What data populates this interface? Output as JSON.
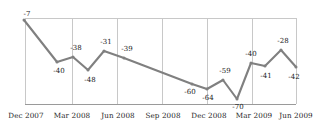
{
  "chart_data": {
    "type": "line",
    "title": "",
    "xlabel": "",
    "ylabel": "",
    "grid": true,
    "legend": false,
    "legend_position": "none",
    "line_color": "#808080",
    "label_color": "#1a1a1a",
    "gridline_color": "#c8c8c8",
    "axis_color": "#9a9a9a",
    "ylim": [
      -75,
      0
    ],
    "categories": [
      "Dec 2007",
      "Jan 2008",
      "Feb 2008",
      "Mar 2008",
      "Apr 2008",
      "May 2008",
      "Jun 2008",
      "Sep 2008",
      "Dec 2008",
      "Jan 2009",
      "Mar 2009",
      "Apr 2009",
      "Jun 2009"
    ],
    "values": [
      -7,
      -40,
      -38,
      -48,
      -31,
      -39,
      -60,
      -64,
      -59,
      -70,
      -40,
      -41,
      -28
    ],
    "point_labels": [
      "-7",
      "-40",
      "-38",
      "-48",
      "-31",
      "-39",
      "-60",
      "-64",
      "-59",
      "-70",
      "-40",
      "-41",
      "-28",
      "-42"
    ],
    "series": [
      {
        "name": "series-1",
        "points": [
          {
            "label": "-7",
            "value": -7,
            "x": 24,
            "y": 20,
            "label_x": 27,
            "label_y": 14,
            "label_align": "above-right"
          },
          {
            "label": "-40",
            "value": -40,
            "x": 57,
            "y": 62,
            "label_x": 59,
            "label_y": 71,
            "label_align": "below"
          },
          {
            "label": "-38",
            "value": -38,
            "x": 73,
            "y": 57,
            "label_x": 76,
            "label_y": 48,
            "label_align": "above"
          },
          {
            "label": "-48",
            "value": -48,
            "x": 88,
            "y": 70,
            "label_x": 90,
            "label_y": 80,
            "label_align": "below"
          },
          {
            "label": "-31",
            "value": -31,
            "x": 104,
            "y": 51,
            "label_x": 106,
            "label_y": 42,
            "label_align": "above"
          },
          {
            "label": "-39",
            "value": -39,
            "x": 124,
            "y": 58,
            "label_x": 127,
            "label_y": 49,
            "label_align": "above"
          },
          {
            "label": "-60",
            "value": -60,
            "x": 192,
            "y": 84,
            "label_x": 190,
            "label_y": 92,
            "label_align": "below"
          },
          {
            "label": "-64",
            "value": -64,
            "x": 207,
            "y": 89,
            "label_x": 208,
            "label_y": 98,
            "label_align": "below"
          },
          {
            "label": "-59",
            "value": -59,
            "x": 223,
            "y": 80,
            "label_x": 225,
            "label_y": 71,
            "label_align": "above"
          },
          {
            "label": "-70",
            "value": -70,
            "x": 237,
            "y": 99,
            "label_x": 238,
            "label_y": 107,
            "label_align": "below"
          },
          {
            "label": "-40",
            "value": -40,
            "x": 251,
            "y": 63,
            "label_x": 251,
            "label_y": 54,
            "label_align": "above"
          },
          {
            "label": "-41",
            "value": -41,
            "x": 265,
            "y": 66,
            "label_x": 266,
            "label_y": 76,
            "label_align": "below"
          },
          {
            "label": "-28",
            "value": -28,
            "x": 281,
            "y": 50,
            "label_x": 283,
            "label_y": 41,
            "label_align": "above"
          },
          {
            "label": "-42",
            "value": -42,
            "x": 296,
            "y": 67,
            "label_x": 294,
            "label_y": 77,
            "label_align": "below"
          }
        ]
      }
    ],
    "xticks": [
      {
        "label": "Dec 2007",
        "x": 26
      },
      {
        "label": "Mar 2008",
        "x": 72
      },
      {
        "label": "Jun 2008",
        "x": 118
      },
      {
        "label": "Sep 2008",
        "x": 163
      },
      {
        "label": "Dec 2008",
        "x": 209
      },
      {
        "label": "Mar 2009",
        "x": 254
      },
      {
        "label": "Jun 2009",
        "x": 296
      }
    ],
    "gridlines_vertical_x": [
      25,
      72,
      117,
      162,
      207,
      252,
      296
    ],
    "gridline_horizontal_y": [
      18
    ],
    "axis_baseline_y": 104,
    "plot_left": 25,
    "plot_right": 296,
    "plot_top": 18,
    "plot_bottom": 104
  }
}
